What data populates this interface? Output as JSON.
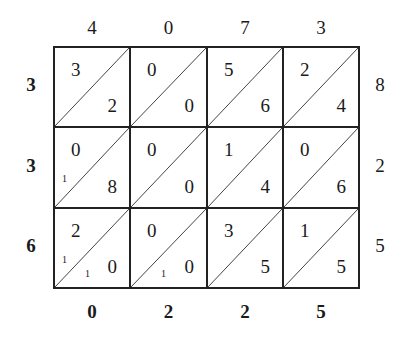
{
  "diagram": {
    "type": "lattice-multiplication",
    "top_digits": [
      "4",
      "0",
      "7",
      "3"
    ],
    "left_digits": [
      "3",
      "3",
      "6"
    ],
    "right_digits": [
      "8",
      "2",
      "5"
    ],
    "bottom_digits": [
      "0",
      "2",
      "2",
      "5"
    ],
    "cells": [
      [
        {
          "tens": "3",
          "ones": "2",
          "carry_left": "",
          "carry_bottom": ""
        },
        {
          "tens": "0",
          "ones": "0",
          "carry_left": "",
          "carry_bottom": ""
        },
        {
          "tens": "5",
          "ones": "6",
          "carry_left": "",
          "carry_bottom": ""
        },
        {
          "tens": "2",
          "ones": "4",
          "carry_left": "",
          "carry_bottom": ""
        }
      ],
      [
        {
          "tens": "0",
          "ones": "8",
          "carry_left": "1",
          "carry_bottom": ""
        },
        {
          "tens": "0",
          "ones": "0",
          "carry_left": "",
          "carry_bottom": ""
        },
        {
          "tens": "1",
          "ones": "4",
          "carry_left": "",
          "carry_bottom": ""
        },
        {
          "tens": "0",
          "ones": "6",
          "carry_left": "",
          "carry_bottom": ""
        }
      ],
      [
        {
          "tens": "2",
          "ones": "0",
          "carry_left": "1",
          "carry_bottom": "1"
        },
        {
          "tens": "0",
          "ones": "0",
          "carry_left": "",
          "carry_bottom": "1"
        },
        {
          "tens": "3",
          "ones": "5",
          "carry_left": "",
          "carry_bottom": ""
        },
        {
          "tens": "1",
          "ones": "5",
          "carry_left": "",
          "carry_bottom": ""
        }
      ]
    ]
  }
}
